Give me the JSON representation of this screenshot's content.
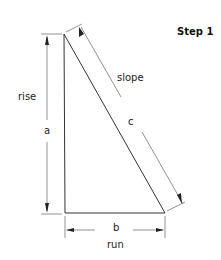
{
  "title": "Step 1",
  "labels": {
    "rise": "rise",
    "a": "a",
    "slope": "slope",
    "c": "c",
    "b": "b",
    "run": "run"
  },
  "colors": {
    "line": "#333333",
    "dim_line": "#777777"
  }
}
